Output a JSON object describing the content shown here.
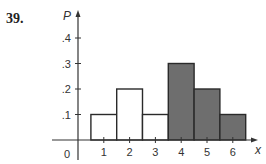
{
  "problem": {
    "number": "39."
  },
  "chart_data": {
    "type": "bar",
    "title": "",
    "xlabel": "x",
    "ylabel": "P",
    "categories": [
      "1",
      "2",
      "3",
      "4",
      "5",
      "6"
    ],
    "values": [
      0.1,
      0.2,
      0.1,
      0.3,
      0.2,
      0.1
    ],
    "shaded": [
      false,
      false,
      false,
      true,
      true,
      true
    ],
    "colors": {
      "unshaded": "#ffffff",
      "shaded": "#6e6e6e",
      "outline": "#2a2a2a"
    },
    "ylim": [
      0,
      0.4
    ],
    "yticks": [
      ".1",
      ".2",
      ".3",
      ".4"
    ],
    "xticks": [
      "1",
      "2",
      "3",
      "4",
      "5",
      "6"
    ],
    "origin_label": "0",
    "grid": false,
    "legend": null
  }
}
